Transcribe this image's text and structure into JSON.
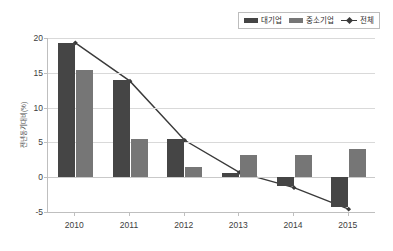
{
  "chart_data": {
    "type": "bar",
    "title": "",
    "subtitle": "",
    "xlabel": "",
    "ylabel": "전년동기대비(%)",
    "categories": [
      "2010",
      "2011",
      "2012",
      "2013",
      "2014",
      "2015"
    ],
    "ylim": [
      -5,
      20
    ],
    "yticks": [
      20,
      15,
      10,
      5,
      0,
      -5
    ],
    "ytick_labels": [
      "20",
      "15",
      "10",
      "5",
      "0",
      "-5"
    ],
    "grid": true,
    "legend_position": "top-right",
    "series": [
      {
        "name": "대기업",
        "kind": "bar",
        "color": "#454545",
        "values": [
          19.3,
          14.0,
          5.5,
          0.6,
          -1.3,
          -4.3
        ]
      },
      {
        "name": "중소기업",
        "kind": "bar",
        "color": "#767676",
        "values": [
          15.4,
          5.5,
          1.5,
          3.2,
          3.2,
          4.0
        ]
      },
      {
        "name": "전체",
        "kind": "line",
        "color": "#3a3a3a",
        "values": [
          19.3,
          13.8,
          5.3,
          0.7,
          -1.5,
          -4.6
        ]
      }
    ]
  },
  "legend": {
    "items": [
      {
        "label": "대기업",
        "marker": "bar-swatch-dark"
      },
      {
        "label": "중소기업",
        "marker": "bar-swatch-light"
      },
      {
        "label": "전체",
        "marker": "line-diamond-marker"
      }
    ]
  },
  "axes": {
    "y_label": "전년동기대비(%)",
    "y_tick_labels": [
      "20",
      "15",
      "10",
      "5",
      "0",
      "-5"
    ],
    "x_tick_labels": [
      "2010",
      "2011",
      "2012",
      "2013",
      "2014",
      "2015"
    ]
  }
}
